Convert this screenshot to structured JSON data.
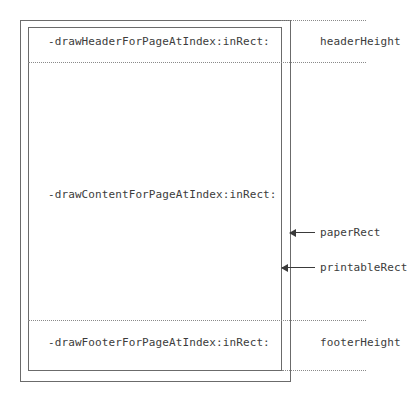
{
  "diagram": {
    "rects": [
      {
        "name": "paperRect",
        "label": "paperRect"
      },
      {
        "name": "printableRect",
        "label": "printableRect"
      }
    ],
    "methods": {
      "header": "-drawHeaderForPageAtIndex:inRect:",
      "content": "-drawContentForPageAtIndex:inRect:",
      "footer": "-drawFooterForPageAtIndex:inRect:"
    },
    "measurements": {
      "header_height": "headerHeight",
      "footer_height": "footerHeight"
    },
    "callouts": {
      "paper_rect": "paperRect",
      "printable_rect": "printableRect"
    },
    "colors": {
      "background": "#ffffff",
      "rect_stroke": "#6b6b6b",
      "guide_stroke": "#8a8a8a",
      "arrow_stroke": "#3a3a3a",
      "text": "#3c3c3c"
    }
  }
}
